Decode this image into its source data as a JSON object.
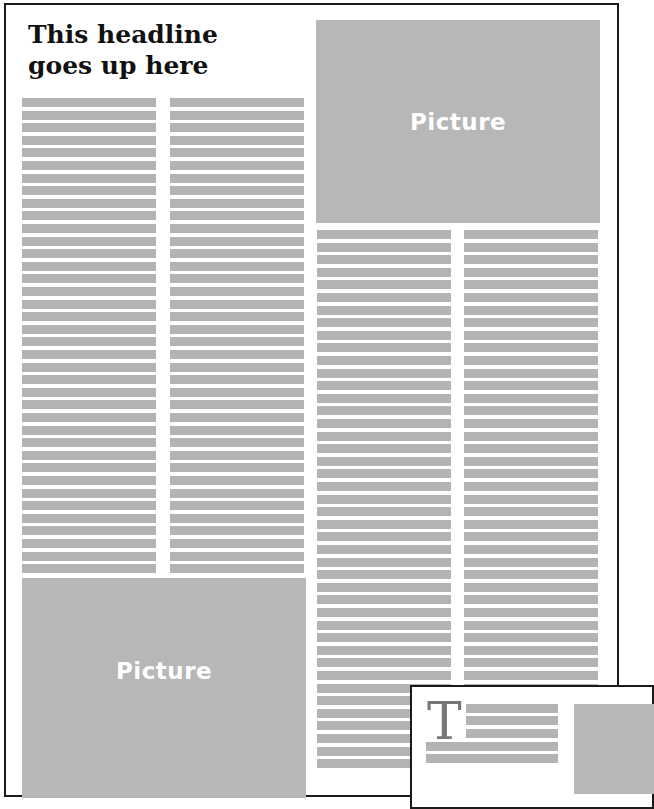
{
  "layout": {
    "headline": "This headline goes up here",
    "picture_label": "Picture",
    "colors": {
      "border": "#1a1a1a",
      "text_line": "#b3b3b3",
      "picture": "#b7b7b7",
      "picture_label": "#ffffff",
      "dropcap": "#777777"
    }
  },
  "main_page": {
    "headline": "This headline goes up here",
    "pictures": [
      {
        "label": "Picture",
        "position": "top-right"
      },
      {
        "label": "Picture",
        "position": "bottom-left"
      }
    ],
    "columns": [
      {
        "name": "column-1",
        "line_count": 38
      },
      {
        "name": "column-2",
        "line_count": 38
      },
      {
        "name": "column-3",
        "line_count": 43
      },
      {
        "name": "column-4",
        "line_count": 37
      }
    ]
  },
  "overlay_page": {
    "dropcap": "T",
    "beside_dropcap_lines": 3,
    "full_lines": 2
  }
}
